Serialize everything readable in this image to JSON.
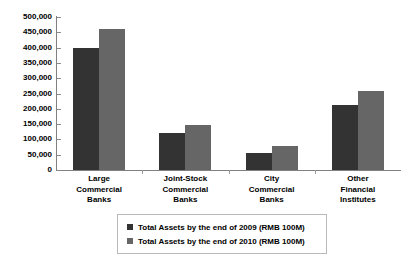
{
  "chart_data": {
    "type": "bar",
    "title": "",
    "xlabel": "",
    "ylabel": "",
    "ylim": [
      0,
      500000
    ],
    "ytick_step": 50000,
    "grid": false,
    "legend_position": "bottom",
    "categories": [
      "Large Commercial Banks",
      "Joint-Stock Commercial Banks",
      "City Commercial Banks",
      "Other Financial Institutes"
    ],
    "category_lines": [
      [
        "Large",
        "Commercial",
        "Banks"
      ],
      [
        "Joint-Stock",
        "Commercial",
        "Banks"
      ],
      [
        "City",
        "Commercial",
        "Banks"
      ],
      [
        "Other",
        "Financial",
        "Institutes"
      ]
    ],
    "ytick_labels": [
      "500,000",
      "450,000",
      "400,000",
      "350,000",
      "300,000",
      "250,000",
      "200,000",
      "150,000",
      "100,000",
      "50,000",
      "0"
    ],
    "ytick_values": [
      500000,
      450000,
      400000,
      350000,
      300000,
      250000,
      200000,
      150000,
      100000,
      50000,
      0
    ],
    "series": [
      {
        "name": "Total Assets by the end of 2009 (RMB 100M)",
        "color": "#333333",
        "values": [
          400000,
          120000,
          56000,
          214000
        ]
      },
      {
        "name": "Total Assets by the end of 2010 (RMB 100M)",
        "color": "#666666",
        "values": [
          460000,
          148000,
          78000,
          259000
        ]
      }
    ]
  },
  "legend": {
    "items": [
      {
        "label": "Total Assets by the end of 2009 (RMB 100M)",
        "color": "#333333"
      },
      {
        "label": "Total Assets by the end of 2010 (RMB 100M)",
        "color": "#666666"
      }
    ]
  },
  "colors": {
    "series_2009": "#333333",
    "series_2010": "#666666",
    "axis": "#808080",
    "legend_border": "#b9b9b9",
    "background": "#ffffff",
    "text": "#000000"
  }
}
